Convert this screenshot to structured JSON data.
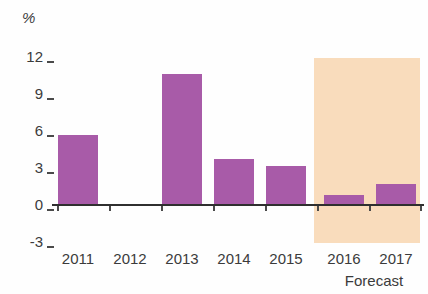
{
  "chart_data": {
    "type": "bar",
    "title": "",
    "subtitle": "",
    "xlabel": "",
    "ylabel": "%",
    "unit_label": "%",
    "categories": [
      "2011",
      "2012",
      "2013",
      "2014",
      "2015",
      "2016",
      "2017"
    ],
    "values": [
      5.7,
      0.1,
      10.6,
      3.7,
      3.2,
      0.8,
      1.7
    ],
    "series": [
      {
        "name": "Annual change",
        "values": [
          5.7,
          0.1,
          10.6,
          3.7,
          3.2,
          0.8,
          1.7
        ],
        "color": "#a85ba8"
      }
    ],
    "ylim": [
      -3,
      12
    ],
    "yticks": [
      12,
      9,
      6,
      3,
      0,
      -3
    ],
    "ytick_labels": [
      "12",
      "9",
      "6",
      "3",
      "0",
      "-3"
    ],
    "grid": false,
    "legend": "none",
    "annotations": [
      {
        "text": "Forecast",
        "covers_categories": [
          "2016",
          "2017"
        ],
        "shading_color": "#f9dcbc"
      }
    ],
    "forecast_label": "Forecast",
    "forecast_categories": [
      "2016",
      "2017"
    ],
    "bar_color": "#a85ba8",
    "forecast_band_color": "#f9dcbc",
    "axis_color": "#2f2f2f"
  }
}
